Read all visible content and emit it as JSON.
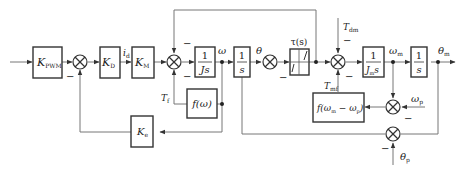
{
  "diagram": {
    "blocks": {
      "kpwm": {
        "label": "K",
        "sub": "PWM"
      },
      "kd": {
        "label": "K",
        "sub": "D"
      },
      "km": {
        "label": "K",
        "sub": "M"
      },
      "js": {
        "num": "1",
        "den": "Js"
      },
      "int1": {
        "num": "1",
        "den": "s"
      },
      "tau": {
        "label": "τ(s)"
      },
      "jms": {
        "num": "1",
        "den": "J",
        "den_sub": "m",
        "den_tail": "s"
      },
      "int2": {
        "num": "1",
        "den": "s"
      },
      "fw": {
        "label": "f(ω)"
      },
      "ke": {
        "label": "K",
        "sub": "e"
      },
      "fwm": {
        "label": "f(ω",
        "sub1": "m",
        "mid": " − ω",
        "sub2": "p",
        "end": ")"
      }
    },
    "signals": {
      "id": {
        "label": "i",
        "sub": "d"
      },
      "omega": {
        "label": "ω"
      },
      "theta": {
        "label": "θ"
      },
      "tf": {
        "label": "T",
        "sub": "f"
      },
      "tdm": {
        "label": "T",
        "sub": "dm"
      },
      "tmf": {
        "label": "T",
        "sub": "mf"
      },
      "omega_m": {
        "label": "ω",
        "sub": "m"
      },
      "theta_m": {
        "label": "θ",
        "sub": "m"
      },
      "omega_p": {
        "label": "ω",
        "sub": "p"
      },
      "theta_p": {
        "label": "θ",
        "sub": "p"
      }
    },
    "signs": {
      "minus": "−"
    },
    "colors": {
      "line": "#777777",
      "block": "#333333",
      "text": "#222222"
    }
  }
}
